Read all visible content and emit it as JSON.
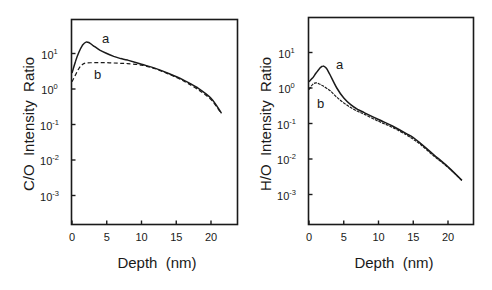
{
  "chart_data": [
    {
      "type": "line",
      "panel": "left",
      "title": "",
      "xlabel": "Depth  (nm)",
      "ylabel": "C/O  Intensity  Ratio",
      "yscale": "log",
      "xlim": [
        0,
        23.5
      ],
      "ylim_exponent": [
        -4,
        1.95
      ],
      "x_ticks": [
        0,
        5,
        10,
        15,
        20
      ],
      "y_ticks": [
        {
          "base": "10",
          "exp": "1"
        },
        {
          "base": "10",
          "exp": "0"
        },
        {
          "base": "10",
          "exp": "-1"
        },
        {
          "base": "10",
          "exp": "-2"
        },
        {
          "base": "10",
          "exp": "-3"
        }
      ],
      "grid": false,
      "series": [
        {
          "name": "a",
          "style": "solid",
          "x": [
            0,
            0.5,
            1,
            1.5,
            2,
            2.5,
            3,
            4,
            5,
            6,
            7,
            8,
            10,
            12,
            14,
            16,
            18,
            20,
            21.5
          ],
          "y": [
            2.8,
            6,
            11,
            17,
            21,
            20,
            17,
            12.5,
            10,
            8.3,
            7.2,
            6.5,
            5.0,
            3.8,
            2.7,
            1.8,
            1.1,
            0.55,
            0.21
          ]
        },
        {
          "name": "b",
          "style": "dashed",
          "x": [
            0,
            0.5,
            1,
            1.5,
            2,
            3,
            4,
            5,
            6,
            7,
            8,
            10,
            12,
            14,
            16,
            18,
            20,
            21.5
          ],
          "y": [
            1.6,
            2.5,
            3.8,
            4.9,
            5.4,
            5.5,
            5.5,
            5.5,
            5.4,
            5.3,
            5.2,
            4.7,
            3.7,
            2.6,
            1.7,
            1.0,
            0.5,
            0.2
          ]
        }
      ],
      "annotations": [
        {
          "text": "a",
          "x": 6.3,
          "y": 24
        },
        {
          "text": "b",
          "x": 6.0,
          "y": 1.7
        }
      ]
    },
    {
      "type": "line",
      "panel": "right",
      "title": "",
      "xlabel": "Depth  (nm)",
      "ylabel": "H/O  Intensity  Ratio",
      "yscale": "log",
      "xlim": [
        0,
        23.5
      ],
      "ylim_exponent": [
        -4,
        1.95
      ],
      "x_ticks": [
        0,
        5,
        10,
        15,
        20
      ],
      "y_ticks": [
        {
          "base": "10",
          "exp": "1"
        },
        {
          "base": "10",
          "exp": "0"
        },
        {
          "base": "10",
          "exp": "-1"
        },
        {
          "base": "10",
          "exp": "-2"
        },
        {
          "base": "10",
          "exp": "-3"
        }
      ],
      "grid": false,
      "series": [
        {
          "name": "a",
          "style": "solid",
          "x": [
            0,
            0.5,
            1,
            1.5,
            2,
            2.5,
            3,
            4,
            5,
            6,
            7,
            8,
            10,
            12,
            14,
            15,
            16,
            18,
            20,
            22
          ],
          "y": [
            1.5,
            1.9,
            2.6,
            3.5,
            4.2,
            3.6,
            2.4,
            1.0,
            0.52,
            0.34,
            0.25,
            0.2,
            0.13,
            0.085,
            0.052,
            0.04,
            0.028,
            0.013,
            0.006,
            0.0025
          ]
        },
        {
          "name": "b",
          "style": "dashed",
          "x": [
            0,
            0.5,
            1,
            1.5,
            2,
            3,
            4,
            5,
            6,
            7,
            8,
            10,
            12,
            14,
            15,
            16,
            18,
            20,
            22
          ],
          "y": [
            0.9,
            1.25,
            1.4,
            1.3,
            1.15,
            0.85,
            0.55,
            0.38,
            0.28,
            0.22,
            0.18,
            0.115,
            0.078,
            0.048,
            0.036,
            0.026,
            0.012,
            0.0058,
            0.0025
          ]
        }
      ],
      "annotations": [
        {
          "text": "a",
          "x": 4.2,
          "y": 5.0
        },
        {
          "text": "b",
          "x": 1.5,
          "y": 0.45
        }
      ]
    }
  ],
  "panels": [
    {
      "ylabel": "C/O  Intensity  Ratio",
      "xlabel": "Depth  (nm)",
      "x_tick_labels": [
        "0",
        "5",
        "10",
        "15",
        "20"
      ],
      "curve_labels": [
        "a",
        "b"
      ]
    },
    {
      "ylabel": "H/O  Intensity  Ratio",
      "xlabel": "Depth  (nm)",
      "x_tick_labels": [
        "0",
        "5",
        "10",
        "15",
        "20"
      ],
      "curve_labels": [
        "a",
        "b"
      ]
    }
  ],
  "colors": {
    "ink": "#1a1a1a",
    "background": "#ffffff"
  }
}
